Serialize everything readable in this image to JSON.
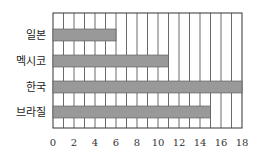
{
  "chart_data": {
    "type": "bar",
    "orientation": "horizontal",
    "title": "",
    "xlabel": "",
    "ylabel": "",
    "categories": [
      "일본",
      "멕시코",
      "한국",
      "브라질"
    ],
    "values": [
      6,
      11,
      18,
      15
    ],
    "xlim": [
      0,
      18
    ],
    "x_ticks": [
      0,
      2,
      4,
      6,
      8,
      10,
      12,
      14,
      16,
      18
    ],
    "grid": {
      "vertical_step": 1,
      "horizontal": false
    },
    "bar_color": "#999999",
    "legend": null
  }
}
